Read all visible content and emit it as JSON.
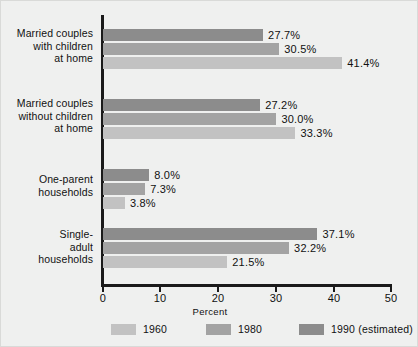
{
  "figure": {
    "background": "#eff0ef",
    "axis_color": "#1a1a1a"
  },
  "chart_data": {
    "type": "bar",
    "orientation": "horizontal",
    "title": "",
    "xlabel": "Percent",
    "ylabel": "",
    "xlim": [
      0,
      50
    ],
    "xticks": [
      0,
      10,
      20,
      30,
      40,
      50
    ],
    "xtick_labels": [
      "0",
      "10",
      "20",
      "30",
      "40",
      "50"
    ],
    "grid": false,
    "legend_position": "bottom",
    "categories": [
      "Married couples with children at home",
      "Married couples without children at home",
      "One-parent households",
      "Single-adult households"
    ],
    "category_label_lines": [
      [
        "Married couples",
        "with children",
        "at home"
      ],
      [
        "Married couples",
        "without children",
        "at home"
      ],
      [
        "One-parent",
        "households"
      ],
      [
        "Single-",
        "adult",
        "households"
      ]
    ],
    "series": [
      {
        "name": "1990 (estimated)",
        "color": "#8c8c8c",
        "values": [
          27.7,
          27.2,
          8.0,
          37.1
        ]
      },
      {
        "name": "1980",
        "color": "#a3a3a3",
        "values": [
          30.5,
          30.0,
          7.3,
          32.2
        ]
      },
      {
        "name": "1960",
        "color": "#c2c2c2",
        "values": [
          41.4,
          33.3,
          3.8,
          21.5
        ]
      }
    ],
    "value_labels": [
      [
        "27.7%",
        "30.5%",
        "41.4%"
      ],
      [
        "27.2%",
        "30.0%",
        "33.3%"
      ],
      [
        "8.0%",
        "7.3%",
        "3.8%"
      ],
      [
        "37.1%",
        "32.2%",
        "21.5%"
      ]
    ]
  },
  "legend": {
    "items": [
      {
        "label": "1960",
        "color": "#c2c2c2"
      },
      {
        "label": "1980",
        "color": "#a3a3a3"
      },
      {
        "label": "1990 (estimated)",
        "color": "#8c8c8c"
      }
    ]
  }
}
